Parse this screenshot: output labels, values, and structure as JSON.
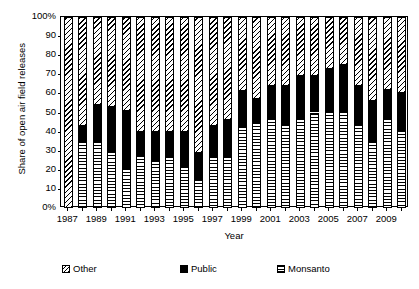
{
  "chart_data": {
    "type": "bar",
    "stacked": true,
    "stacked_normalized": true,
    "title": "",
    "xlabel": "Year",
    "ylabel": "Share of open air field releases",
    "ylim": [
      0,
      100
    ],
    "yticks": [
      0,
      10,
      20,
      30,
      40,
      50,
      60,
      70,
      80,
      90,
      100
    ],
    "ytick_labels": [
      "0%",
      "10",
      "20",
      "30",
      "40",
      "50",
      "60",
      "70",
      "80",
      "90",
      "100%"
    ],
    "grid": false,
    "legend_position": "bottom",
    "categories": [
      "1987",
      "1988",
      "1989",
      "1990",
      "1991",
      "1992",
      "1993",
      "1994",
      "1995",
      "1996",
      "1997",
      "1998",
      "1999",
      "2000",
      "2001",
      "2002",
      "2003",
      "2004",
      "2005",
      "2006",
      "2007",
      "2008",
      "2009",
      "2010"
    ],
    "xtick_labels_shown": [
      "1987",
      "1989",
      "1991",
      "1993",
      "1995",
      "1997",
      "1999",
      "2001",
      "2003",
      "2005",
      "2007",
      "2009"
    ],
    "series": [
      {
        "name": "Monsanto",
        "pattern": "horizontal-hatch",
        "values": [
          0,
          35,
          35,
          30,
          21,
          28,
          25,
          27,
          22,
          15,
          27,
          27,
          43,
          45,
          47,
          44,
          47,
          50,
          51,
          51,
          44,
          35,
          47,
          41
        ]
      },
      {
        "name": "Public",
        "pattern": "solid-black",
        "values": [
          0,
          8,
          19,
          23,
          30,
          12,
          15,
          13,
          18,
          14,
          16,
          19,
          18,
          12,
          17,
          20,
          22,
          19,
          22,
          24,
          20,
          21,
          15,
          19
        ]
      },
      {
        "name": "Other",
        "pattern": "diagonal-hatch",
        "values": [
          100,
          57,
          46,
          47,
          49,
          60,
          60,
          60,
          60,
          71,
          57,
          54,
          39,
          43,
          36,
          36,
          31,
          31,
          27,
          25,
          36,
          44,
          38,
          40
        ]
      }
    ]
  },
  "legend": {
    "items": [
      {
        "label": "Other",
        "pattern": "diagonal-hatch"
      },
      {
        "label": "Public",
        "pattern": "solid-black"
      },
      {
        "label": "Monsanto",
        "pattern": "horizontal-hatch"
      }
    ]
  }
}
